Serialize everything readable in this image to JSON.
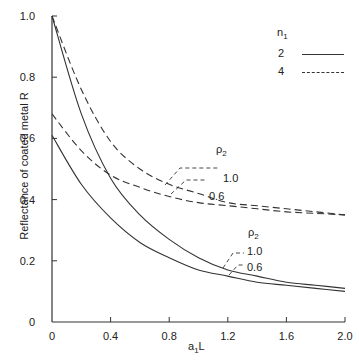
{
  "chart_data": {
    "type": "line",
    "title": "",
    "xlabel": "a1L",
    "ylabel": "Reflectance of coated metal R",
    "xlim": [
      0,
      2.0
    ],
    "ylim": [
      0,
      1.0
    ],
    "x_ticks": [
      "0",
      "0.4",
      "0.8",
      "1.2",
      "1.6",
      "2.0"
    ],
    "y_ticks": [
      "0",
      "0.2",
      "0.4",
      "0.6",
      "0.8",
      "1.0"
    ],
    "grid": false,
    "legend": {
      "title": "n1",
      "position": "upper right",
      "entries": [
        {
          "label": "2",
          "style": "solid"
        },
        {
          "label": "4",
          "style": "dashed"
        }
      ]
    },
    "annotations": [
      {
        "group": "dashed (n1=4)",
        "title": "ρ2",
        "labels": [
          "1.0",
          "0.6"
        ]
      },
      {
        "group": "solid (n1=2)",
        "title": "ρ2",
        "labels": [
          "1.0",
          "0.6"
        ]
      }
    ],
    "x": [
      0,
      0.2,
      0.4,
      0.6,
      0.8,
      1.0,
      1.2,
      1.4,
      1.6,
      1.8,
      2.0
    ],
    "series": [
      {
        "name": "n1=2, ρ2=1.0",
        "style": "solid",
        "values": [
          1.0,
          0.68,
          0.47,
          0.35,
          0.27,
          0.21,
          0.17,
          0.15,
          0.13,
          0.12,
          0.11
        ]
      },
      {
        "name": "n1=2, ρ2=0.6",
        "style": "solid",
        "values": [
          0.61,
          0.45,
          0.34,
          0.26,
          0.21,
          0.17,
          0.15,
          0.13,
          0.12,
          0.11,
          0.1
        ]
      },
      {
        "name": "n1=4, ρ2=1.0",
        "style": "dashed",
        "values": [
          1.0,
          0.76,
          0.59,
          0.5,
          0.45,
          0.42,
          0.39,
          0.38,
          0.37,
          0.36,
          0.35
        ]
      },
      {
        "name": "n1=4, ρ2=0.6",
        "style": "dashed",
        "values": [
          0.68,
          0.56,
          0.48,
          0.44,
          0.41,
          0.39,
          0.38,
          0.37,
          0.36,
          0.355,
          0.35
        ]
      }
    ]
  },
  "labels": {
    "ylabel": "Reflectance of coated metal R",
    "xlabel_main": "a",
    "xlabel_sub": "1",
    "xlabel_tail": "L",
    "legend_title_main": "n",
    "legend_title_sub": "1",
    "legend_entry_1": "2",
    "legend_entry_2": "4",
    "rho_main": "ρ",
    "rho_sub": "2",
    "rho_val_1": "1.0",
    "rho_val_2": "0.6"
  }
}
